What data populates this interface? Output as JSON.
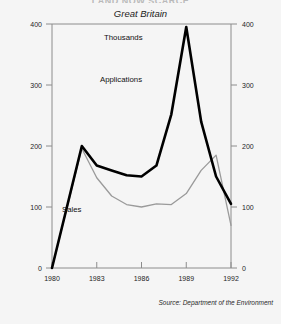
{
  "figure": {
    "clipped_heading": "LAND NOW SCARCE",
    "subtitle": "Great Britain",
    "source_note": "Source: Department of the Environment",
    "unit_label": "Thousands",
    "background_color": "#f5f5f5"
  },
  "series_labels": {
    "applications": "Applications",
    "sales": "Sales"
  },
  "axis_text": {
    "y_left": [
      "400",
      "300",
      "200",
      "100",
      "0"
    ],
    "y_right": [
      "400",
      "300",
      "200",
      "100",
      "0"
    ],
    "x_years": [
      "1980",
      "1983",
      "1986",
      "1989",
      "1992"
    ]
  },
  "chart_data": {
    "type": "line",
    "title": "Great Britain",
    "subtitle": "Thousands",
    "xlabel": "",
    "ylabel": "Thousands",
    "xlim": [
      1980,
      1992
    ],
    "ylim": [
      0,
      400
    ],
    "yticks": [
      0,
      100,
      200,
      300,
      400
    ],
    "xticks": [
      1980,
      1983,
      1986,
      1989,
      1992
    ],
    "grid": false,
    "legend": "inline-annotations",
    "x": [
      1980,
      1981,
      1982,
      1983,
      1984,
      1985,
      1986,
      1987,
      1988,
      1989,
      1990,
      1991,
      1992
    ],
    "series": [
      {
        "name": "Applications",
        "color": "#000000",
        "width": 2.6,
        "values": [
          0,
          100,
          200,
          168,
          160,
          152,
          150,
          168,
          252,
          395,
          240,
          150,
          105
        ]
      },
      {
        "name": "Sales",
        "color": "#9a9a9a",
        "width": 1.3,
        "values": [
          0,
          98,
          196,
          148,
          118,
          104,
          100,
          105,
          104,
          122,
          160,
          185,
          70
        ]
      }
    ]
  }
}
